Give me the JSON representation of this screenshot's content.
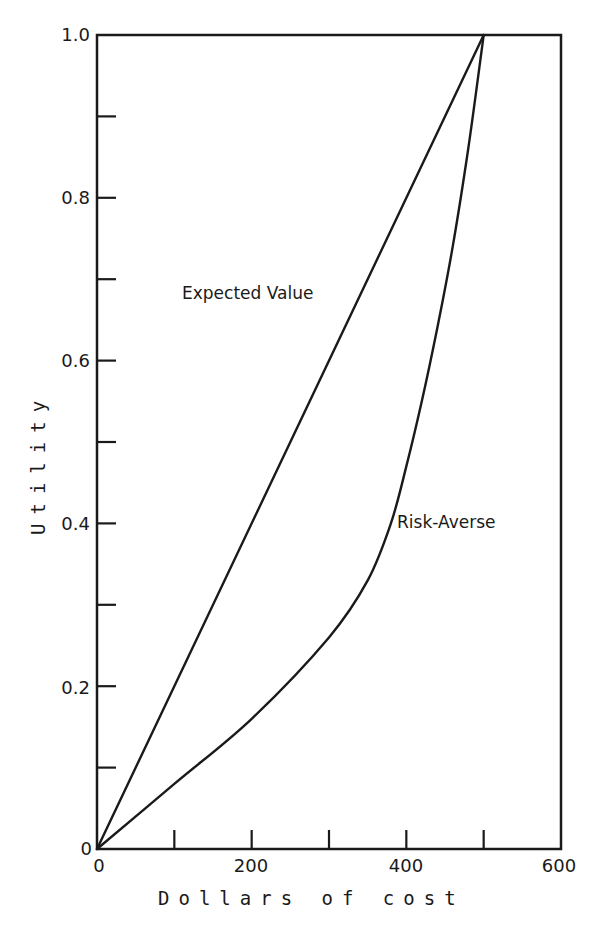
{
  "chart_data": {
    "type": "line",
    "title": "",
    "xlabel": "Dollars of cost",
    "ylabel": "Utility",
    "xlim": [
      0,
      600
    ],
    "ylim": [
      0,
      1.0
    ],
    "x_ticks": [
      0,
      100,
      200,
      300,
      400,
      500,
      600
    ],
    "x_tick_labels": [
      "0",
      "",
      "200",
      "",
      "400",
      "",
      "600"
    ],
    "y_ticks": [
      0,
      0.1,
      0.2,
      0.3,
      0.4,
      0.5,
      0.6,
      0.7,
      0.8,
      0.9,
      1.0
    ],
    "y_tick_labels": [
      "0",
      "",
      "0.2",
      "",
      "0.4",
      "",
      "0.6",
      "",
      "0.8",
      "",
      "1.0"
    ],
    "grid": false,
    "legend": "inline labels",
    "series": [
      {
        "name": "Expected Value",
        "x": [
          0,
          500
        ],
        "y": [
          0,
          1.0
        ],
        "label_position": {
          "x": 170,
          "y": 0.68
        }
      },
      {
        "name": "Risk-Averse",
        "x": [
          0,
          100,
          200,
          300,
          350,
          380,
          400,
          420,
          440,
          460,
          480,
          500
        ],
        "y": [
          0,
          0.08,
          0.16,
          0.26,
          0.33,
          0.4,
          0.47,
          0.55,
          0.64,
          0.74,
          0.86,
          1.0
        ],
        "label_position": {
          "x": 410,
          "y": 0.4
        }
      }
    ]
  },
  "labels": {
    "xlabel": "Dollars of cost",
    "ylabel": "Utility",
    "expected_value": "Expected Value",
    "risk_averse": "Risk-Averse",
    "x_tick_0": "0",
    "x_tick_200": "200",
    "x_tick_400": "400",
    "x_tick_600": "600",
    "y_tick_0": "0",
    "y_tick_02": "0.2",
    "y_tick_04": "0.4",
    "y_tick_06": "0.6",
    "y_tick_08": "0.8",
    "y_tick_10": "1.0"
  }
}
